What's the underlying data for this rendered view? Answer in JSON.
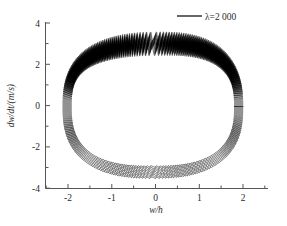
{
  "chart_data": {
    "type": "line",
    "title": "",
    "subtitle": "",
    "xlabel": "w/h",
    "ylabel": "dw/dt/(m/s)",
    "xlim": [
      -2.5,
      2.5
    ],
    "ylim": [
      -4,
      4
    ],
    "xticks": [
      -2,
      -1,
      0,
      1,
      2
    ],
    "xtick_labels": [
      "-2",
      "-1",
      "0",
      "1",
      "2"
    ],
    "yticks": [
      -4,
      -2,
      0,
      2,
      4
    ],
    "ytick_labels": [
      "-4",
      "-2",
      "0",
      "2",
      "4"
    ],
    "x_minor_ticks": [
      -2.5,
      -1.5,
      -0.5,
      0.5,
      1.5,
      2.5
    ],
    "y_minor_ticks": [
      -3,
      -1,
      1,
      3
    ],
    "grid": false,
    "legend_position": "top-right",
    "series": [
      {
        "name": "λ=2 000",
        "color": "#000000",
        "description": "phase-portrait limit cycle band with high-frequency ripple",
        "cycle": {
          "x_min": -2.02,
          "x_max": 1.9,
          "y_min": -3.22,
          "y_max": 3.12,
          "x_center": -0.06,
          "y_center": -0.05,
          "ripple_amplitude": 0.3,
          "ripple_count": 260,
          "band_thickness": 0.55
        }
      }
    ],
    "annotations": []
  },
  "legend": {
    "entries": [
      {
        "label": "λ=2 000",
        "color": "#000000"
      }
    ]
  },
  "axes": {
    "x_title": "w/h",
    "y_title": "dw/dt/(m/s)"
  }
}
